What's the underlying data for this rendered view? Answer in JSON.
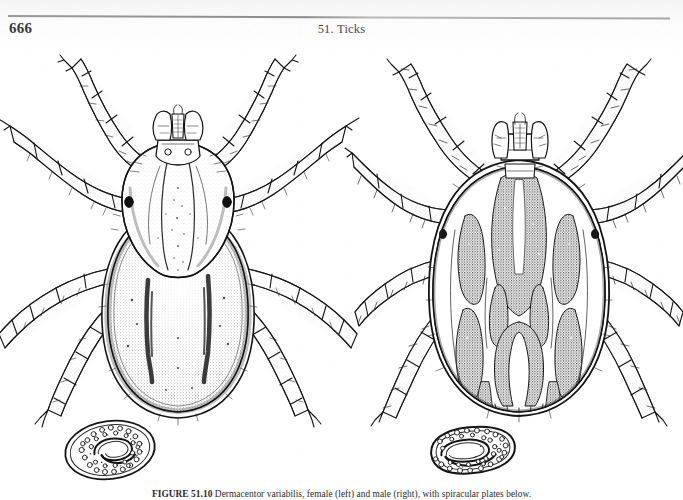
{
  "page": {
    "folio": "666",
    "running_title": "51. Ticks",
    "background_color": "#ffffff",
    "ink_color": "#1a1a1a",
    "rule_color": "#9a9a9a"
  },
  "figure": {
    "caption_label": "FIGURE 51.10",
    "caption_text": "Dermacentor variabilis, female (left) and male (right), with spiracular plates below.",
    "panels": [
      {
        "id": "tick-left",
        "name": "female-tick-dorsal-view",
        "label": "female",
        "description": "Dorsal view of an engorging female ixodid tick showing pale inornate scutum, capitulum with palps and hypostome, and four pairs of legs",
        "spiracle": {
          "id": "spiracle-left",
          "name": "spiracular-plate-female",
          "shape": "oval",
          "description": "Oval spiracular plate with goblet cells and central macula"
        }
      },
      {
        "id": "tick-right",
        "name": "male-tick-dorsal-view",
        "label": "male",
        "description": "Dorsal view of a male ixodid tick with ornate patterned scutum covering the entire dorsum, capitulum and four pairs of legs",
        "spiracle": {
          "id": "spiracle-right",
          "name": "spiracular-plate-male",
          "shape": "comma-oval",
          "description": "Comma-shaped spiracular plate with numerous goblets and central macula"
        }
      }
    ]
  }
}
